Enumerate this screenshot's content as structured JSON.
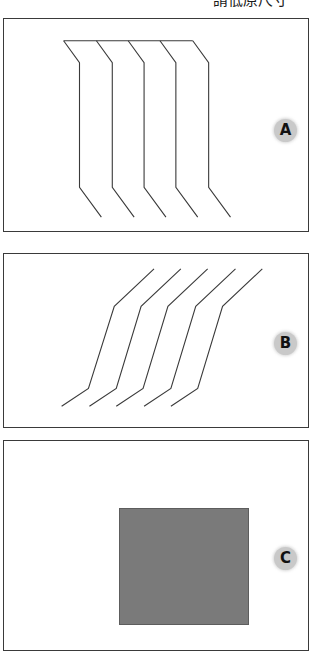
{
  "figure": {
    "width": 318,
    "height": 657,
    "background_color": "#ffffff",
    "caption_top": "請低原尺寸",
    "panel_border_color": "#3a3a3a",
    "stroke_color": "#3a3a3a",
    "badge_fill_color": "#c9c9c9",
    "badge_text_color": "#111111"
  },
  "panels": [
    {
      "id": "A",
      "badge_label": "A",
      "content_type": "polyline-set",
      "description": "Five S-bend polylines: horizontal top run, diagonal shoulder, long vertical shaft, diagonal foot.",
      "line_count": 5
    },
    {
      "id": "B",
      "badge_label": "B",
      "content_type": "polyline-set",
      "description": "Five separate three-segment polylines: shallow up-right top, steep middle shaft, shallow down-left foot.",
      "line_count": 5
    },
    {
      "id": "C",
      "badge_label": "C",
      "content_type": "filled-rectangle",
      "description": "Single solid gray rectangle with darker outline.",
      "rect_fill_color": "#7a7a7a",
      "rect_border_color": "#5d5d5d"
    }
  ],
  "chart_data": {
    "type": "line",
    "title": "請低原尺寸",
    "xlabel": "",
    "ylabel": "",
    "panels": [
      {
        "panel": "A",
        "viewbox": [
          0,
          0,
          306,
          214
        ],
        "stroke": "#3a3a3a",
        "stroke_width": 1.1,
        "top_rail": {
          "x1": 60,
          "y1": 22,
          "x2": 190,
          "y2": 22
        },
        "series": [
          {
            "name": "A1",
            "points": [
              [
                60,
                22
              ],
              [
                76,
                44
              ],
              [
                76,
                170
              ],
              [
                98,
                200
              ]
            ]
          },
          {
            "name": "A2",
            "points": [
              [
                93,
                22
              ],
              [
                109,
                44
              ],
              [
                109,
                170
              ],
              [
                131,
                200
              ]
            ]
          },
          {
            "name": "A3",
            "points": [
              [
                125,
                22
              ],
              [
                141,
                44
              ],
              [
                141,
                170
              ],
              [
                163,
                200
              ]
            ]
          },
          {
            "name": "A4",
            "points": [
              [
                157,
                22
              ],
              [
                173,
                44
              ],
              [
                173,
                170
              ],
              [
                195,
                200
              ]
            ]
          },
          {
            "name": "A5",
            "points": [
              [
                190,
                22
              ],
              [
                206,
                44
              ],
              [
                206,
                170
              ],
              [
                228,
                200
              ]
            ]
          }
        ]
      },
      {
        "panel": "B",
        "viewbox": [
          0,
          0,
          306,
          175
        ],
        "stroke": "#3a3a3a",
        "stroke_width": 1.1,
        "series": [
          {
            "name": "B1",
            "points": [
              [
                151,
                15
              ],
              [
                111,
                53
              ],
              [
                85,
                136
              ],
              [
                58,
                154
              ]
            ]
          },
          {
            "name": "B2",
            "points": [
              [
                178,
                15
              ],
              [
                138,
                53
              ],
              [
                113,
                136
              ],
              [
                86,
                154
              ]
            ]
          },
          {
            "name": "B3",
            "points": [
              [
                205,
                15
              ],
              [
                165,
                53
              ],
              [
                140,
                136
              ],
              [
                113,
                154
              ]
            ]
          },
          {
            "name": "B4",
            "points": [
              [
                233,
                15
              ],
              [
                193,
                53
              ],
              [
                168,
                136
              ],
              [
                141,
                154
              ]
            ]
          },
          {
            "name": "B5",
            "points": [
              [
                260,
                15
              ],
              [
                220,
                53
              ],
              [
                195,
                136
              ],
              [
                168,
                154
              ]
            ]
          }
        ]
      },
      {
        "panel": "C",
        "viewbox": [
          0,
          0,
          306,
          211
        ],
        "rect": {
          "x": 115,
          "y": 67,
          "width": 130,
          "height": 117
        },
        "fill": "#7a7a7a",
        "stroke": "#5d5d5d"
      }
    ]
  }
}
